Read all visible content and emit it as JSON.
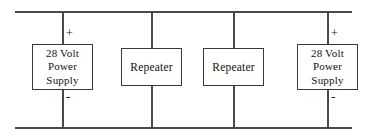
{
  "diagram": {
    "type": "electrical-schematic",
    "background_color": "#ffffff",
    "line_color": "#4a4a4a",
    "box_border_color": "#3a3a3a",
    "text_color": "#111111",
    "rails": [
      {
        "name": "positive-rail",
        "label": "",
        "y": 11,
        "x1": 15,
        "x2": 352
      },
      {
        "name": "negative-rail",
        "label": "",
        "y": 127,
        "x1": 15,
        "x2": 352
      }
    ],
    "wires": [
      {
        "name": "wire-left-supply",
        "x": 62,
        "y1": 11,
        "y2": 127
      },
      {
        "name": "wire-repeater-1",
        "x": 151,
        "y1": 11,
        "y2": 127
      },
      {
        "name": "wire-repeater-2",
        "x": 233,
        "y1": 11,
        "y2": 127
      },
      {
        "name": "wire-right-supply",
        "x": 327,
        "y1": 11,
        "y2": 127
      }
    ],
    "components": [
      {
        "id": "left-power-supply",
        "kind": "power-supply",
        "lines": [
          "28 Volt",
          "Power",
          "Supply"
        ],
        "x": 32,
        "y": 44,
        "width": 61,
        "height": 46
      },
      {
        "id": "repeater-1",
        "kind": "repeater",
        "lines": [
          "Repeater"
        ],
        "x": 121,
        "y": 48,
        "width": 61,
        "height": 38
      },
      {
        "id": "repeater-2",
        "kind": "repeater",
        "lines": [
          "Repeater"
        ],
        "x": 203,
        "y": 48,
        "width": 61,
        "height": 38
      },
      {
        "id": "right-power-supply",
        "kind": "power-supply",
        "lines": [
          "28 Volt",
          "Power",
          "Supply"
        ],
        "x": 297,
        "y": 44,
        "width": 61,
        "height": 46
      }
    ],
    "polarity_marks": [
      {
        "id": "left-plus",
        "symbol": "+",
        "x": 66,
        "y": 28
      },
      {
        "id": "left-minus",
        "symbol": "-",
        "x": 66,
        "y": 92
      },
      {
        "id": "right-plus",
        "symbol": "+",
        "x": 331,
        "y": 28
      },
      {
        "id": "right-minus",
        "symbol": "-",
        "x": 331,
        "y": 92
      }
    ]
  }
}
